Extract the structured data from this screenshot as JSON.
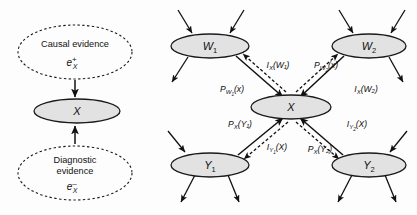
{
  "figure": {
    "left_panel": {
      "causal_evidence": {
        "text": "Causal evidence",
        "symbol": "e",
        "superscript": "+",
        "subscript": "X"
      },
      "diagnostic_evidence": {
        "text_line1": "Diagnostic",
        "text_line2": "evidence",
        "symbol": "e",
        "superscript": "–",
        "subscript": "X"
      },
      "center_node": {
        "label": "X"
      }
    },
    "right_panel": {
      "nodes": [
        {
          "name": "node-w1",
          "label": "W",
          "subscript": "1"
        },
        {
          "name": "node-w2",
          "label": "W",
          "subscript": "2"
        },
        {
          "name": "node-x",
          "label": "X",
          "subscript": ""
        },
        {
          "name": "node-y1",
          "label": "Y",
          "subscript": "1"
        },
        {
          "name": "node-y2",
          "label": "Y",
          "subscript": "2"
        }
      ],
      "messages": [
        {
          "name": "msg-pi-w1",
          "head": "P",
          "sub": "W",
          "sub2": "1",
          "arg": "(x)"
        },
        {
          "name": "msg-lambda-x-w1",
          "head": "I",
          "sub": "X",
          "sub2": "",
          "arg": "(W₁)"
        },
        {
          "name": "msg-pi-w2",
          "head": "P",
          "sub": "W",
          "sub2": "2",
          "arg": "(x)"
        },
        {
          "name": "msg-lambda-x-w2",
          "head": "I",
          "sub": "X",
          "sub2": "",
          "arg": "(W₂)"
        },
        {
          "name": "msg-pi-x-y1",
          "head": "P",
          "sub": "X",
          "sub2": "",
          "arg": "(Y₁)"
        },
        {
          "name": "msg-lambda-y1-x",
          "head": "I",
          "sub": "Y",
          "sub2": "1",
          "arg": "(X)"
        },
        {
          "name": "msg-pi-x-y2",
          "head": "P",
          "sub": "X",
          "sub2": "",
          "arg": "(Y₂)"
        },
        {
          "name": "msg-lambda-y2-x",
          "head": "I",
          "sub": "Y",
          "sub2": "2",
          "arg": "(X)"
        }
      ]
    },
    "colors": {
      "node_fill": "#e2e2e2",
      "stroke": "#111111",
      "background": "#ffffff"
    }
  }
}
